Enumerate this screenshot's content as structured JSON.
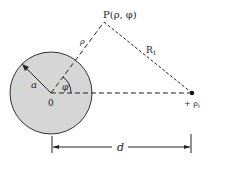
{
  "diagram": {
    "point_label": "P(ρ, φ)",
    "rho_label": "ρ",
    "R1_label": "R",
    "R1_sub": "1",
    "radius_label": "a",
    "angle_label": "φ",
    "origin_label": "0",
    "charge_label": "+ ρ",
    "charge_sub": "ℓ",
    "distance_label": "d",
    "colors": {
      "cylinder_fill": "#d6d6d6",
      "stroke": "#333333"
    }
  }
}
